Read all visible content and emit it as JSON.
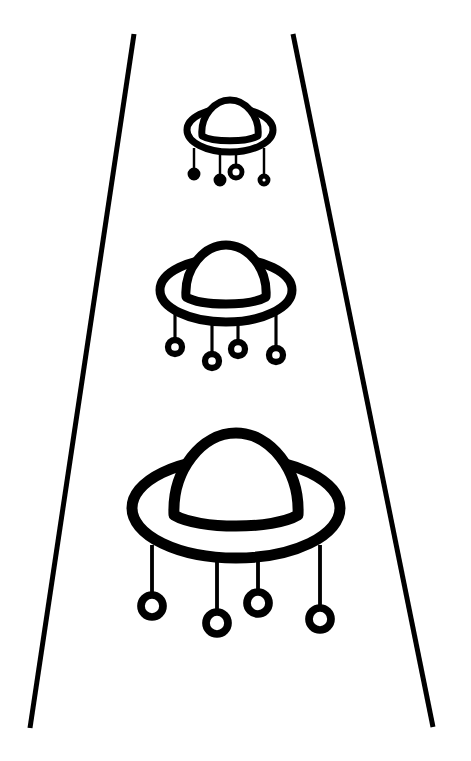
{
  "canvas": {
    "width": 471,
    "height": 761,
    "background": "#ffffff",
    "ink": "#000000"
  },
  "beam": {
    "left": {
      "x1": 134,
      "y1": 34,
      "x2": 30,
      "y2": 728
    },
    "right": {
      "x1": 293,
      "y1": 34,
      "x2": 433,
      "y2": 727
    },
    "stroke_width": 5
  },
  "ufos": [
    {
      "name": "ufo-small",
      "cx": 230,
      "rim_cy": 130,
      "rim_rx": 43,
      "rim_ry": 22,
      "dome_w": 56,
      "dome_h": 36,
      "dome_base_y": 136,
      "stroke": 7,
      "legs": [
        {
          "x": 194,
          "y_top": 148,
          "len": 22,
          "r": 4,
          "filled": true
        },
        {
          "x": 220,
          "y_top": 152,
          "len": 24,
          "r": 4,
          "filled": true
        },
        {
          "x": 236,
          "y_top": 152,
          "len": 14,
          "r": 6,
          "filled": false
        },
        {
          "x": 264,
          "y_top": 148,
          "len": 28,
          "r": 4,
          "filled": false
        }
      ]
    },
    {
      "name": "ufo-medium",
      "cx": 226,
      "rim_cy": 290,
      "rim_rx": 66,
      "rim_ry": 32,
      "dome_w": 80,
      "dome_h": 52,
      "dome_base_y": 297,
      "stroke": 9,
      "legs": [
        {
          "x": 175,
          "y_top": 314,
          "len": 26,
          "r": 7,
          "filled": false
        },
        {
          "x": 212,
          "y_top": 320,
          "len": 34,
          "r": 7,
          "filled": false
        },
        {
          "x": 238,
          "y_top": 320,
          "len": 22,
          "r": 7,
          "filled": false
        },
        {
          "x": 276,
          "y_top": 312,
          "len": 36,
          "r": 7,
          "filled": false
        }
      ]
    },
    {
      "name": "ufo-large",
      "cx": 236,
      "rim_cy": 508,
      "rim_rx": 104,
      "rim_ry": 50,
      "dome_w": 124,
      "dome_h": 82,
      "dome_base_y": 515,
      "stroke": 11,
      "legs": [
        {
          "x": 152,
          "y_top": 545,
          "len": 50,
          "r": 11,
          "filled": false
        },
        {
          "x": 217,
          "y_top": 555,
          "len": 57,
          "r": 11,
          "filled": false
        },
        {
          "x": 258,
          "y_top": 555,
          "len": 37,
          "r": 11,
          "filled": false
        },
        {
          "x": 320,
          "y_top": 545,
          "len": 63,
          "r": 11,
          "filled": false
        }
      ]
    }
  ]
}
